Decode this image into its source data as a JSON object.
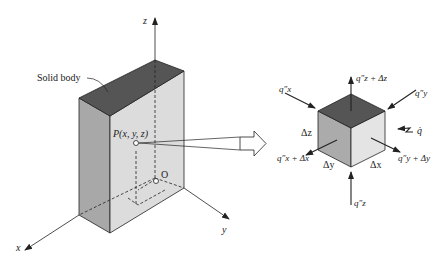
{
  "diagram": {
    "left_figure": {
      "body_label": "Solid body",
      "point_label": "P(x, y, z)",
      "origin_label": "O",
      "axes": {
        "x": "x",
        "y": "y",
        "z": "z"
      }
    },
    "right_figure": {
      "flux_labels": {
        "qx_in": "q″x",
        "qx_out": "q″x + Δx",
        "qy_in": "q″y",
        "qy_out": "q″y + Δy",
        "qz_in": "q″z",
        "qz_out": "q″z + Δz",
        "generation": "q̇"
      },
      "dimension_labels": {
        "dx": "Δx",
        "dy": "Δy",
        "dz": "Δz"
      }
    },
    "colors": {
      "top_face": "#555555",
      "front_face": "#d9d9d9",
      "side_face": "#a9a9a9",
      "right_face": "#e6e6e6",
      "line": "#222222"
    }
  }
}
